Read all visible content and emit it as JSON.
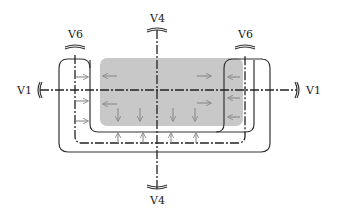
{
  "diagram": {
    "type": "section-view schematic",
    "labels": {
      "v4_top": "V4",
      "v4_bottom": "V4",
      "v1_left": "V1",
      "v1_right": "V1",
      "v6_left": "V6",
      "v6_right": "V6"
    },
    "colors": {
      "gray_region": "#c8c8c8",
      "lines": "#333333",
      "arrows": "#8a8a8a"
    },
    "arrows": {
      "left_arm": "right",
      "right_arm": "left",
      "bottom_channel": "up",
      "gray_upper_left": "left",
      "gray_upper_right": "right",
      "gray_middle_left": "left",
      "gray_middle_right": "right",
      "gray_bottom": "down"
    }
  }
}
